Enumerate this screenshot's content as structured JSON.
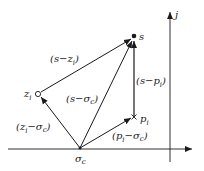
{
  "diagram": {
    "title": "",
    "axes": {
      "imaginary_axis_label": "j"
    },
    "points": {
      "s": {
        "label": "s",
        "x": 134,
        "y": 37,
        "marker": "filled-dot"
      },
      "z_i": {
        "label": "z",
        "sub": "i",
        "x": 38,
        "y": 94,
        "marker": "open-circle"
      },
      "p_i": {
        "label": "p",
        "sub": "i",
        "x": 134,
        "y": 117,
        "marker": "cross"
      },
      "sigma_c": {
        "label": "σ",
        "sub": "c",
        "x": 80,
        "y": 148,
        "marker": "dot"
      }
    },
    "vectors": [
      {
        "from": "z_i",
        "to": "s",
        "label_pre": "(s−z",
        "label_sub": "i",
        "label_post": ")"
      },
      {
        "from": "sigma_c",
        "to": "s",
        "label_pre": "(s−σ",
        "label_sub": "c",
        "label_post": ")"
      },
      {
        "from": "p_i",
        "to": "s",
        "label_pre": "(s−p",
        "label_sub": "i",
        "label_post": ")"
      },
      {
        "from": "sigma_c",
        "to": "z_i",
        "label_pre": "(z",
        "label_sub": "i",
        "label_mid": "−σ",
        "label_sub2": "c",
        "label_post": ")"
      },
      {
        "from": "sigma_c",
        "to": "p_i",
        "label_pre": "(p",
        "label_sub": "i",
        "label_mid": "−σ",
        "label_sub2": "c",
        "label_post": ")"
      }
    ],
    "colors": {
      "ink": "#1a1a1a",
      "background": "#ffffff"
    }
  }
}
